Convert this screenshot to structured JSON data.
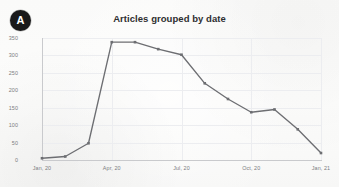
{
  "badge": {
    "label": "A",
    "color": "#19191a"
  },
  "chart_data": {
    "type": "line",
    "title": "Articles grouped by date",
    "xlabel": "",
    "ylabel": "",
    "x": [
      "Jan, 20",
      "Feb, 20",
      "Mar, 20",
      "Apr, 20",
      "May, 20",
      "Jun, 20",
      "Jul, 20",
      "Aug, 20",
      "Sep, 20",
      "Oct, 20",
      "Nov, 20",
      "Dec, 20",
      "Jan, 21"
    ],
    "values": [
      5,
      10,
      48,
      338,
      338,
      318,
      302,
      220,
      175,
      137,
      145,
      88,
      20
    ],
    "series": [
      {
        "name": "Articles",
        "values": [
          5,
          10,
          48,
          338,
          338,
          318,
          302,
          220,
          175,
          137,
          145,
          88,
          20
        ]
      }
    ],
    "ylim": [
      0,
      350
    ],
    "yticks": [
      0,
      50,
      100,
      150,
      200,
      250,
      300,
      350
    ],
    "ytick_labels": [
      "0",
      "50",
      "100",
      "150",
      "200",
      "250",
      "300",
      "350"
    ],
    "xtick_labels": [
      "Jan, 20",
      "Apr, 20",
      "Jul, 20",
      "Oct, 20",
      "Jan, 21"
    ],
    "xtick_indices": [
      0,
      3,
      6,
      9,
      12
    ],
    "grid": true,
    "legend": "none",
    "line_color": "#6d6e72",
    "marker": "square",
    "marker_color": "#6d6e72"
  }
}
